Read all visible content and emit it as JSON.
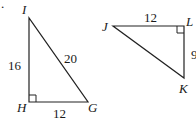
{
  "diagram": {
    "triangles": [
      {
        "name": "IHG",
        "vertices": {
          "I": "I",
          "H": "H",
          "G": "G"
        },
        "right_angle_at": "H",
        "sides": {
          "IH": "16",
          "IG": "20",
          "HG": "12"
        }
      },
      {
        "name": "JLK",
        "vertices": {
          "J": "J",
          "L": "L",
          "K": "K"
        },
        "right_angle_at": "L",
        "sides": {
          "JL": "12",
          "LK": "9"
        }
      }
    ],
    "marker": "."
  }
}
